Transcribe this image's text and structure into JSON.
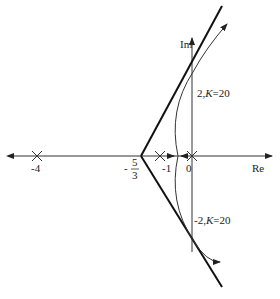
{
  "diagram": {
    "type": "root-locus",
    "axes": {
      "real_label": "Re",
      "imag_label": "Im"
    },
    "poles": [
      {
        "label": "-4",
        "value": -4
      },
      {
        "label": "-1",
        "value": -1
      },
      {
        "label": "0",
        "value": 0
      }
    ],
    "centroid": {
      "num": "5",
      "den": "3",
      "sign": "-"
    },
    "crossings": [
      {
        "label": "2, K=20",
        "pre": "2,",
        "k": "K",
        "eq": "=20"
      },
      {
        "label": "-2, K=20",
        "pre": "-2,",
        "k": "K",
        "eq": "=20"
      }
    ],
    "colors": {
      "asymptote": "#111111",
      "locus": "#333333",
      "axis": "#333333"
    }
  }
}
